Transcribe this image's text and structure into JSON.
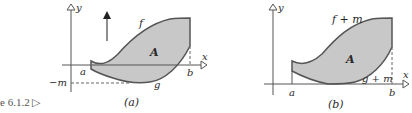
{
  "caption": {
    "text": "e 6.1.2 ▷"
  },
  "panel_a": {
    "label": "(a)",
    "axis_y_label": "y",
    "axis_x_label": "x",
    "upper_curve_label": "f",
    "lower_curve_label": "g",
    "region_label": "A",
    "left_bound_label": "a",
    "right_bound_label": "b",
    "offset_label": "−m",
    "arrow": "up-arrow"
  },
  "panel_b": {
    "label": "(b)",
    "axis_y_label": "y",
    "axis_x_label": "x",
    "upper_curve_label": "f + m",
    "lower_curve_label": "g + m",
    "region_label": "A",
    "left_bound_label": "a",
    "right_bound_label": "b"
  },
  "colors": {
    "region_fill": "#c8c8c8",
    "stroke": "#555555"
  }
}
